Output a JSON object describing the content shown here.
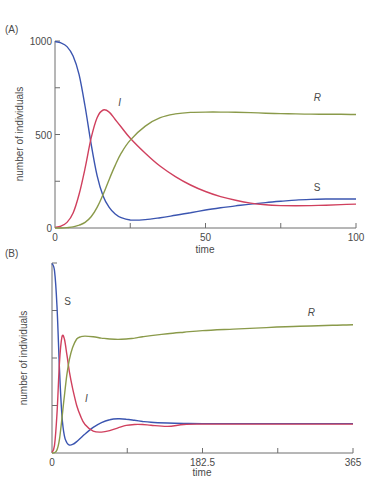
{
  "colors": {
    "S": "#3b55b0",
    "I": "#d0405e",
    "R": "#8a9a4a",
    "axis": "#6e6e6e",
    "text": "#4a4a4a"
  },
  "chart_data": [
    {
      "panel_label": "(A)",
      "type": "line",
      "title": "",
      "xlabel": "time",
      "ylabel": "number of individuals",
      "xlim": [
        0,
        100
      ],
      "ylim": [
        0,
        1000
      ],
      "x_ticks": [
        0,
        25,
        50,
        75,
        100
      ],
      "x_tick_labels": [
        "0",
        "",
        "50",
        "",
        "100"
      ],
      "y_ticks": [
        0,
        250,
        500,
        750,
        1000
      ],
      "y_tick_labels": [
        "0",
        "",
        "500",
        "",
        "1000"
      ],
      "grid": false,
      "legend": "inline curve labels",
      "x": [
        0,
        2,
        4,
        6,
        8,
        10,
        12,
        14,
        16,
        18,
        20,
        22,
        25,
        30,
        35,
        40,
        45,
        50,
        55,
        60,
        65,
        70,
        75,
        80,
        85,
        90,
        95,
        100
      ],
      "series": [
        {
          "name": "S",
          "label": "S",
          "values": [
            997,
            990,
            970,
            920,
            820,
            650,
            450,
            280,
            170,
            110,
            75,
            55,
            43,
            45,
            55,
            68,
            82,
            96,
            108,
            118,
            128,
            136,
            143,
            149,
            153,
            155,
            155,
            155
          ]
        },
        {
          "name": "I",
          "label": "I",
          "values": [
            3,
            10,
            30,
            80,
            180,
            320,
            480,
            590,
            631,
            620,
            580,
            540,
            480,
            400,
            330,
            275,
            230,
            195,
            168,
            148,
            133,
            124,
            120,
            119,
            120,
            122,
            125,
            128
          ]
        },
        {
          "name": "R",
          "label": "R",
          "values": [
            0,
            0,
            2,
            6,
            15,
            30,
            60,
            110,
            180,
            260,
            335,
            400,
            470,
            545,
            590,
            610,
            618,
            620,
            620,
            619,
            617,
            614,
            612,
            610,
            609,
            608,
            608,
            607
          ]
        }
      ],
      "annotations": [
        {
          "text": "I",
          "x": 21,
          "y": 650
        },
        {
          "text": "R",
          "x": 86,
          "y": 680
        },
        {
          "text": "S",
          "x": 86,
          "y": 200
        }
      ]
    },
    {
      "panel_label": "(B)",
      "type": "line",
      "title": "",
      "xlabel": "time",
      "ylabel": "number of individuals",
      "xlim": [
        0,
        365
      ],
      "ylim": [
        0,
        1000
      ],
      "x_ticks": [
        0,
        91.25,
        182.5,
        273.75,
        365
      ],
      "x_tick_labels": [
        "0",
        "",
        "182.5",
        "",
        "365"
      ],
      "y_ticks": [
        0,
        250,
        500,
        750,
        1000
      ],
      "y_tick_labels": [
        "0",
        "",
        "",
        "",
        ""
      ],
      "grid": false,
      "legend": "inline curve labels",
      "x": [
        0,
        3,
        6,
        9,
        12,
        15,
        18,
        21,
        25,
        30,
        35,
        40,
        50,
        60,
        70,
        80,
        90,
        100,
        110,
        120,
        140,
        160,
        182.5,
        220,
        260,
        300,
        340,
        365
      ],
      "series": [
        {
          "name": "S",
          "label": "S",
          "values": [
            997,
            960,
            780,
            450,
            200,
            90,
            55,
            42,
            45,
            60,
            80,
            100,
            135,
            160,
            175,
            180,
            178,
            172,
            166,
            162,
            158,
            156,
            155,
            155,
            155,
            155,
            155,
            155
          ]
        },
        {
          "name": "I",
          "label": "I",
          "values": [
            3,
            40,
            200,
            470,
            610,
            600,
            520,
            430,
            340,
            250,
            190,
            150,
            115,
            110,
            118,
            132,
            145,
            150,
            150,
            146,
            140,
            150,
            152,
            152,
            152,
            152,
            152,
            152
          ]
        },
        {
          "name": "R",
          "label": "R",
          "values": [
            0,
            2,
            15,
            70,
            180,
            300,
            410,
            490,
            555,
            600,
            612,
            615,
            612,
            605,
            600,
            598,
            600,
            605,
            612,
            618,
            628,
            636,
            644,
            652,
            660,
            667,
            672,
            675
          ]
        }
      ],
      "annotations": [
        {
          "text": "S",
          "x": 15,
          "y": 780
        },
        {
          "text": "R",
          "x": 310,
          "y": 720
        },
        {
          "text": "I",
          "x": 40,
          "y": 270
        }
      ]
    }
  ]
}
